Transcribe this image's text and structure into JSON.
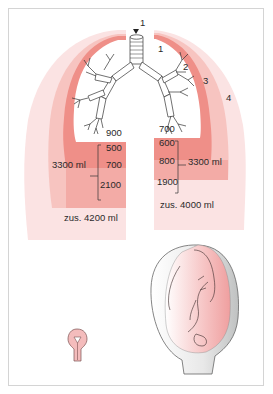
{
  "figure": {
    "type": "anatomical-diagram",
    "colors": {
      "outer_zone": "#fbe3e3",
      "mid_zone": "#f6b9b5",
      "inner_band": "#ef8f88",
      "lower_band": "#f3a9a4",
      "bronchi_stroke": "#333333",
      "uterus_gray": "#cfd0d0",
      "fetus_pink": "#f2b2b2",
      "frame_border": "#d4d4d4"
    },
    "markers": {
      "trachea_label": "1",
      "right_1": "1",
      "right_2": "2",
      "right_3": "3",
      "right_4": "4"
    },
    "left_lung": {
      "values": [
        "900",
        "500",
        "700",
        "2100"
      ],
      "bracket_label": "3300 ml",
      "total": "zus. 4200 ml"
    },
    "right_lung": {
      "values": [
        "700",
        "600",
        "800",
        "1900"
      ],
      "bracket_label": "3300 ml",
      "total": "zus. 4000 ml"
    },
    "illustrations": {
      "small_uterus": "non-pregnant-uterus-icon",
      "pregnant_uterus": "pregnant-uterus-with-fetus-icon"
    }
  }
}
